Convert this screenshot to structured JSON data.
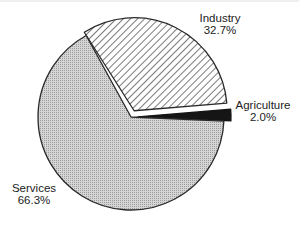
{
  "chart_data": {
    "type": "pie",
    "title": "",
    "exploded": true,
    "slices": [
      {
        "label": "Industry",
        "value": 32.7,
        "display": "32.7%",
        "pattern": "diagonal-hatch",
        "color": "#ffffff",
        "stroke": "#2a2a2a"
      },
      {
        "label": "Agriculture",
        "value": 2.0,
        "display": "2.0%",
        "pattern": "solid",
        "color": "#151515",
        "stroke": "#151515"
      },
      {
        "label": "Services",
        "value": 66.3,
        "display": "66.3%",
        "pattern": "fine-dot-gray",
        "color": "#c9c9c9",
        "stroke": "#2a2a2a"
      }
    ],
    "legend": "none (direct labels)"
  },
  "labels": {
    "industry": {
      "name": "Industry",
      "pct": "32.7%"
    },
    "agriculture": {
      "name": "Agriculture",
      "pct": "2.0%"
    },
    "services": {
      "name": "Services",
      "pct": "66.3%"
    }
  }
}
